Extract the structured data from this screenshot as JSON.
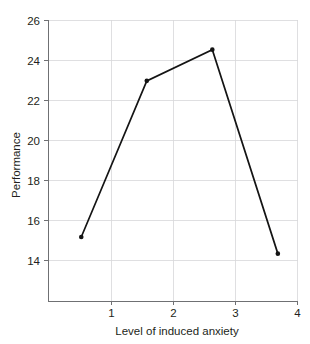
{
  "chart_data": {
    "type": "line",
    "title": "",
    "subtitle": "",
    "xlabel": "Level of induced anxiety",
    "ylabel": "Performance",
    "x": [
      1,
      2,
      3,
      4
    ],
    "values": [
      16,
      23.5,
      25,
      15.2
    ],
    "categories": [
      "1",
      "2",
      "3",
      "4"
    ],
    "xlim": [
      0.5,
      4.3
    ],
    "ylim": [
      12.9,
      26.4
    ],
    "xticks": [
      1,
      2,
      3,
      4
    ],
    "xtick_labels": [
      "1",
      "2",
      "3",
      "4"
    ],
    "yticks": [
      14,
      16,
      18,
      20,
      22,
      24,
      26
    ],
    "ytick_labels": [
      "14",
      "16",
      "18",
      "20",
      "22",
      "24",
      "26"
    ],
    "grid": true,
    "grid_color": "#d7d7d9",
    "legend": false,
    "legend_position": "none",
    "series": [
      {
        "name": "Performance",
        "color": "#141414",
        "marker": "dot",
        "points": [
          {
            "x": 1,
            "y": 16
          },
          {
            "x": 2,
            "y": 23.5
          },
          {
            "x": 3,
            "y": 25
          },
          {
            "x": 4,
            "y": 15.2
          }
        ]
      }
    ],
    "annotations": []
  },
  "axes": {
    "y_axis_label": "Performance",
    "x_axis_label": "Level of induced anxiety",
    "y_tick_0": "14",
    "y_tick_1": "16",
    "y_tick_2": "18",
    "y_tick_3": "20",
    "y_tick_4": "22",
    "y_tick_5": "24",
    "y_tick_6": "26",
    "x_tick_0": "1",
    "x_tick_1": "2",
    "x_tick_2": "3",
    "x_tick_3": "4"
  },
  "colors": {
    "line": "#141414",
    "grid": "#d7d7d9",
    "spine": "#6f7073",
    "text": "#231f20",
    "background": "#ffffff"
  }
}
